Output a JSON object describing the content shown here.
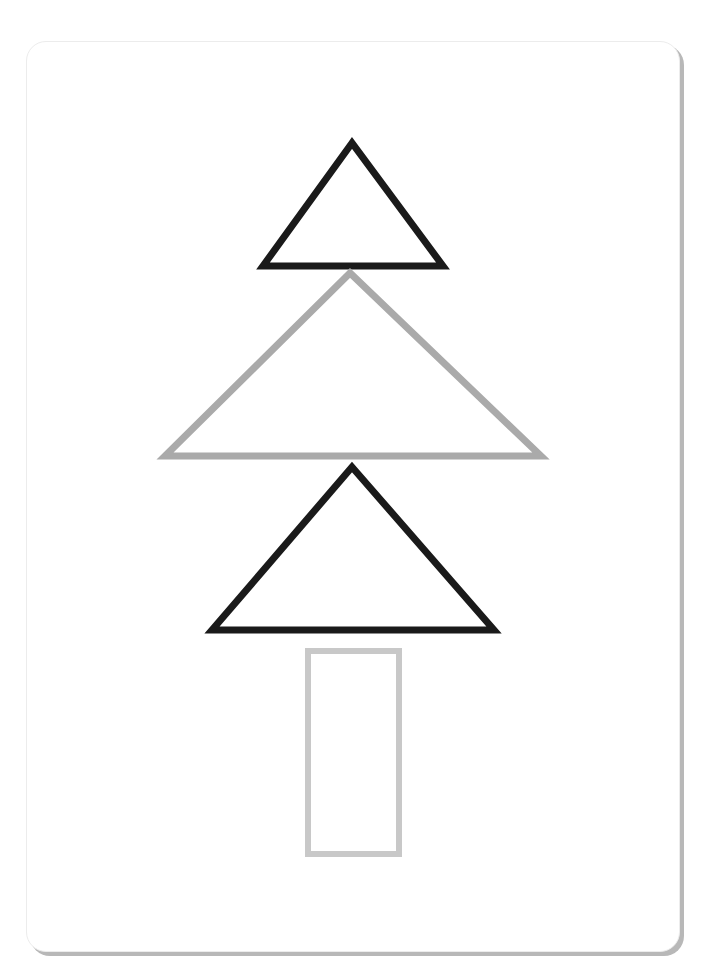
{
  "canvas": {
    "width": 714,
    "height": 977,
    "background": "#ffffff"
  },
  "card": {
    "border_color": "#ececec",
    "shadow_color": "#b8b8b8"
  },
  "shapes": [
    {
      "name": "top-triangle",
      "type": "triangle",
      "points": "352,143 263,266 443,266",
      "stroke": "#1a1a1a",
      "stroke_width": 7
    },
    {
      "name": "middle-triangle",
      "type": "triangle",
      "points": "350,273 165,456 541,456",
      "stroke": "#aaaaaa",
      "stroke_width": 7
    },
    {
      "name": "bottom-triangle",
      "type": "triangle",
      "points": "352,467 212,630 494,630",
      "stroke": "#1a1a1a",
      "stroke_width": 7
    },
    {
      "name": "trunk-rectangle",
      "type": "rect",
      "x": 308,
      "y": 651,
      "width": 91,
      "height": 203,
      "stroke": "#c8c8c8",
      "stroke_width": 6
    }
  ]
}
